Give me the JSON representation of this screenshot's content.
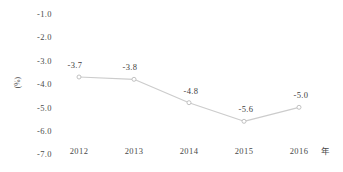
{
  "chart_data": {
    "type": "line",
    "title": "",
    "xlabel": "年",
    "ylabel": "(%)",
    "categories": [
      "2012",
      "2013",
      "2014",
      "2015",
      "2016"
    ],
    "values": [
      -3.7,
      -3.8,
      -4.8,
      -5.6,
      -5.0
    ],
    "point_labels": [
      "-3.7",
      "-3.8",
      "-4.8",
      "-5.6",
      "-5.0"
    ],
    "yticks": [
      "-1.0",
      "-2.0",
      "-3.0",
      "-4.0",
      "-5.0",
      "-6.0",
      "-7.0"
    ],
    "ytick_values": [
      -1.0,
      -2.0,
      -3.0,
      -4.0,
      -5.0,
      -6.0,
      -7.0
    ],
    "ylim": [
      -7.0,
      -1.0
    ],
    "grid": false,
    "legend": null,
    "series": [
      {
        "name": "",
        "values": [
          -3.7,
          -3.8,
          -4.8,
          -5.6,
          -5.0
        ]
      }
    ],
    "line_color": "#cccccc",
    "marker": "open-circle",
    "marker_color": "#bbbbbb"
  }
}
